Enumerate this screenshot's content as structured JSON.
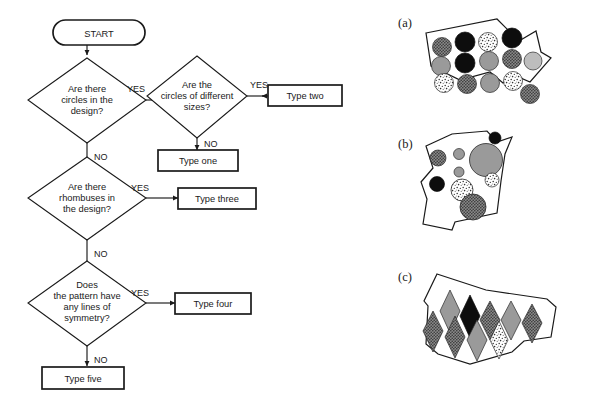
{
  "figure": {
    "type": "flowchart-with-illustrations",
    "flowchart": {
      "start": {
        "label": "START",
        "shape": "rounded-terminator"
      },
      "decisions": [
        {
          "id": "d1",
          "lines": [
            "Are there",
            "circles in the",
            "design?"
          ],
          "yes": "d2",
          "no": "d3"
        },
        {
          "id": "d2",
          "lines": [
            "Are the",
            "circles of different",
            "sizes?"
          ],
          "yes": "type-two",
          "no": "type-one"
        },
        {
          "id": "d3",
          "lines": [
            "Are there",
            "rhombuses in",
            "the design?"
          ],
          "yes": "type-three",
          "no": "d4"
        },
        {
          "id": "d4",
          "lines": [
            "Does",
            "the pattern have",
            "any lines of",
            "symmetry?"
          ],
          "yes": "type-four",
          "no": "type-five"
        }
      ],
      "outcomes": [
        {
          "id": "type-one",
          "label": "Type one"
        },
        {
          "id": "type-two",
          "label": "Type two"
        },
        {
          "id": "type-three",
          "label": "Type three"
        },
        {
          "id": "type-four",
          "label": "Type four"
        },
        {
          "id": "type-five",
          "label": "Type five"
        }
      ],
      "edge_labels": {
        "yes": "YES",
        "no": "NO"
      }
    },
    "illustrations": [
      {
        "id": "a",
        "label": "(a)",
        "shape_kind": "circles",
        "description": "irregular quadrilateral tile filled with equal-sized circles",
        "circle_count": 12,
        "sizes_equal": true,
        "fills": [
          "dotted",
          "black",
          "speckle",
          "black",
          "gray",
          "black",
          "gray",
          "dark-dotted",
          "light-gray",
          "speckle",
          "dark-dotted",
          "gray",
          "speckle",
          "dotted"
        ]
      },
      {
        "id": "b",
        "label": "(b)",
        "shape_kind": "circles",
        "description": "irregular polygon tile filled with circles of different sizes",
        "circle_count": 9,
        "sizes_equal": false,
        "fills": [
          "black",
          "gray",
          "light-gray",
          "gray-large",
          "gray-small",
          "black",
          "speckle",
          "speckle-small",
          "dark-dotted"
        ]
      },
      {
        "id": "c",
        "label": "(c)",
        "shape_kind": "rhombuses",
        "description": "irregular polygon tile filled with rhombuses (diamonds)",
        "rhombus_count": 10,
        "fills": [
          "gray",
          "black",
          "dark-dotted",
          "gray",
          "dark-dotted",
          "dark-dotted",
          "gray",
          "gray",
          "speckle"
        ]
      }
    ],
    "colors": {
      "stroke": "#1a1a1a",
      "fill_white": "#ffffff",
      "fill_black": "#0d0d0d",
      "fill_gray": "#9a9a9a",
      "fill_light_gray": "#bdbdbd",
      "fill_dark_gray": "#6e6e6e"
    }
  }
}
